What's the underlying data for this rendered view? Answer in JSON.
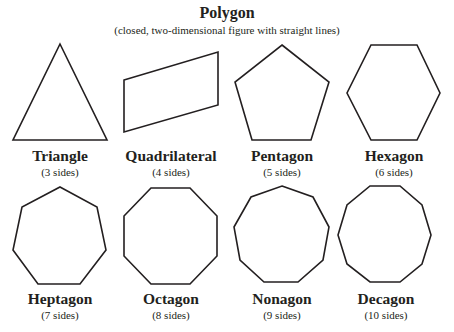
{
  "header": {
    "title": "Polygon",
    "subtitle": "(closed, two-dimensional figure with straight lines)"
  },
  "colors": {
    "stroke": "#231f20",
    "background": "#ffffff"
  },
  "shapes": [
    {
      "name": "Triangle",
      "sides_label": "(3 sides)",
      "sides": 3
    },
    {
      "name": "Quadrilateral",
      "sides_label": "(4 sides)",
      "sides": 4
    },
    {
      "name": "Pentagon",
      "sides_label": "(5 sides)",
      "sides": 5
    },
    {
      "name": "Hexagon",
      "sides_label": "(6 sides)",
      "sides": 6
    },
    {
      "name": "Heptagon",
      "sides_label": "(7 sides)",
      "sides": 7
    },
    {
      "name": "Octagon",
      "sides_label": "(8 sides)",
      "sides": 8
    },
    {
      "name": "Nonagon",
      "sides_label": "(9 sides)",
      "sides": 9
    },
    {
      "name": "Decagon",
      "sides_label": "(10 sides)",
      "sides": 10
    }
  ]
}
